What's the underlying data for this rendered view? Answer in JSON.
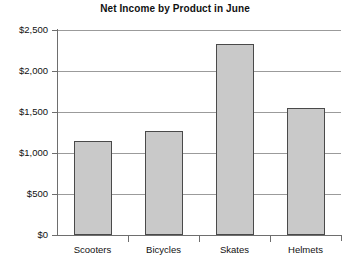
{
  "chart_data": {
    "type": "bar",
    "title": "Net Income by Product in June",
    "categories": [
      "Scooters",
      "Bicycles",
      "Skates",
      "Helmets"
    ],
    "values": [
      1150,
      1270,
      2330,
      1550
    ],
    "xlabel": "",
    "ylabel": "",
    "ylim": [
      0,
      2500
    ],
    "ytick_values": [
      0,
      500,
      1000,
      1500,
      2000,
      2500
    ],
    "ytick_labels": [
      "$0",
      "$500",
      "$1,000",
      "$1,500",
      "$2,000",
      "$2,500"
    ],
    "grid": true,
    "legend": false,
    "bar_fill_color": "#c9c9c9",
    "bar_border_color": "#4a4a4a",
    "axis_color": "#6e6e6e",
    "gridline_color": "#9b9b9b"
  }
}
